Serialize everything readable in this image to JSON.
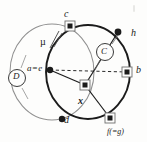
{
  "figure": {
    "type": "geometric-diagram",
    "background_color": "#fdfdfc",
    "ink_color": "#1b1b1b",
    "faint_ink_color": "#8e8e8e",
    "labels": {
      "point_c": "c",
      "point_h": "h",
      "point_b": "b",
      "point_a_equals_e": "a=e",
      "point_x": "x",
      "point_d": "d",
      "point_f_equals_g": "f(=g)",
      "mu": "µ",
      "circle_C": "C",
      "circle_D": "D"
    },
    "points": [
      {
        "name": "c",
        "x": 70,
        "y": 26,
        "marker": "square"
      },
      {
        "name": "h",
        "x": 118,
        "y": 32,
        "marker": "dot"
      },
      {
        "name": "b",
        "x": 127,
        "y": 72,
        "marker": "square"
      },
      {
        "name": "a=e",
        "x": 50,
        "y": 70,
        "marker": "dot"
      },
      {
        "name": "x",
        "x": 85,
        "y": 85,
        "marker": "square"
      },
      {
        "name": "d",
        "x": 62,
        "y": 119,
        "marker": "dot"
      },
      {
        "name": "f(=g)",
        "x": 110,
        "y": 118,
        "marker": "square"
      }
    ],
    "circles": [
      {
        "name": "C",
        "cx": 88,
        "cy": 72,
        "r": 44,
        "stroke": "#1b1b1b",
        "weight": "heavy"
      },
      {
        "name": "D",
        "cx": 52,
        "cy": 72,
        "r": 42,
        "stroke": "#8e8e8e",
        "weight": "light"
      }
    ],
    "segments": [
      {
        "from": "a=e",
        "to": "b",
        "style": "dashed"
      },
      {
        "from": "a=e",
        "to": "x",
        "style": "solid"
      },
      {
        "from": "x",
        "to": "h",
        "style": "solid"
      },
      {
        "from": "x",
        "to": "f(=g)",
        "style": "solid"
      }
    ]
  }
}
